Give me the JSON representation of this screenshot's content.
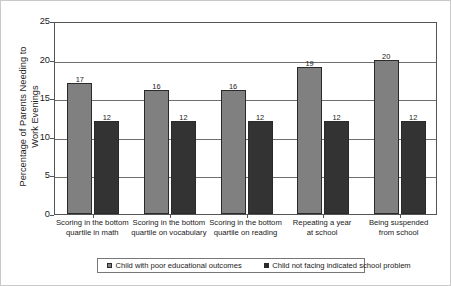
{
  "chart_data": {
    "type": "bar",
    "title": "",
    "subtitle": "",
    "xlabel": "",
    "ylabel": "Percentage of Parents Needing to Work Evenings",
    "ylabel_line1": "Percentage of Parents Needing to",
    "ylabel_line2": "Work Evenings",
    "ylim": [
      0,
      25
    ],
    "ytick_labels": [
      "0",
      "5",
      "10",
      "15",
      "20",
      "25"
    ],
    "ytick_values": [
      0,
      5,
      10,
      15,
      20,
      25
    ],
    "grid": true,
    "grid_axis": "y",
    "legend_position": "bottom",
    "categories": [
      "Scoring in the bottom quartile in math",
      "Scoring in the bottom quartile on vocabulary",
      "Scoring in the bottom quartile on reading",
      "Repeating a year at school",
      "Being suspended from school"
    ],
    "category_lines": [
      [
        "Scoring in the bottom",
        "quartile in math"
      ],
      [
        "Scoring in the bottom",
        "quartile on vocabulary"
      ],
      [
        "Scoring in the bottom",
        "quartile on reading"
      ],
      [
        "Repeating a year",
        "at school"
      ],
      [
        "Being suspended",
        "from school"
      ]
    ],
    "series": [
      {
        "name": "Child with poor educational outcomes",
        "color": "#808080",
        "values": [
          17,
          16,
          16,
          19,
          20
        ],
        "labels": [
          "17",
          "16",
          "16",
          "19",
          "20"
        ]
      },
      {
        "name": "Child not facing indicated school problem",
        "color": "#333333",
        "values": [
          12,
          12,
          12,
          12,
          12
        ],
        "labels": [
          "12",
          "12",
          "12",
          "12",
          "12"
        ]
      }
    ]
  },
  "legend": {
    "entries": [
      {
        "label": "Child with poor educational outcomes"
      },
      {
        "label": "Child not facing indicated school problem"
      }
    ]
  }
}
